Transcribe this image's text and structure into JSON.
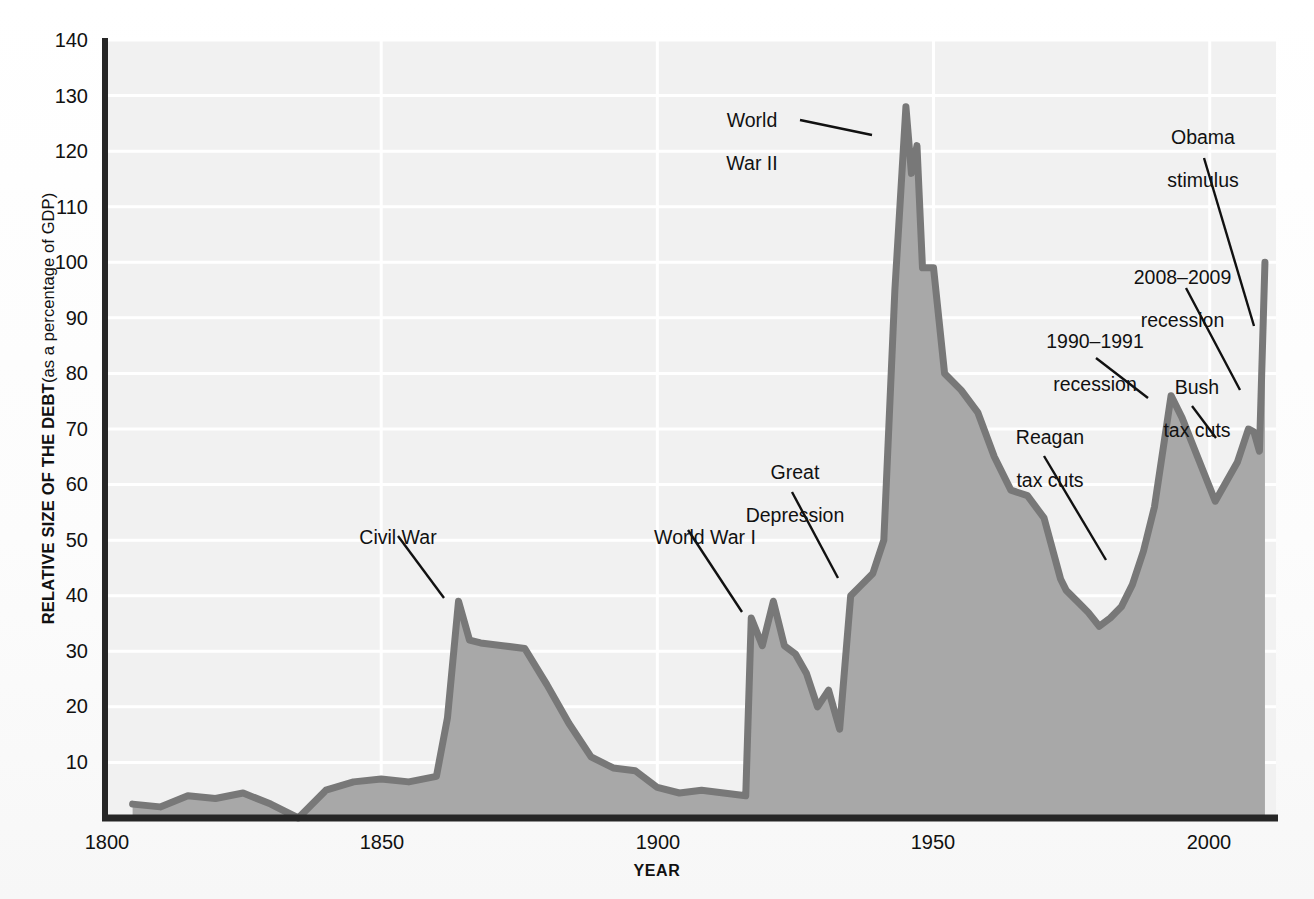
{
  "chart_data": {
    "type": "area",
    "title": "",
    "xlabel": "YEAR",
    "ylabel_bold": "RELATIVE SIZE OF THE DEBT",
    "ylabel_regular": "(as a percentage of GDP)",
    "xlim": [
      1800,
      2012
    ],
    "ylim": [
      0,
      140
    ],
    "xticks": [
      1800,
      1850,
      1900,
      1950,
      2000
    ],
    "xticklabels": [
      "1800",
      "1850",
      "1900",
      "1950",
      "2000"
    ],
    "yticks": [
      10,
      20,
      30,
      40,
      50,
      60,
      70,
      80,
      90,
      100,
      110,
      120,
      130,
      140
    ],
    "yticklabels": [
      "10",
      "20",
      "30",
      "40",
      "50",
      "60",
      "70",
      "80",
      "90",
      "100",
      "110",
      "120",
      "130",
      "140"
    ],
    "grid": "horizontal-and-vertical-white-gridlines",
    "legend": "none",
    "series_name": "U.S. federal debt as a percentage of GDP",
    "x": [
      1805,
      1810,
      1815,
      1820,
      1825,
      1830,
      1835,
      1840,
      1845,
      1850,
      1855,
      1860,
      1862,
      1864,
      1866,
      1868,
      1872,
      1876,
      1880,
      1884,
      1888,
      1892,
      1896,
      1900,
      1904,
      1908,
      1912,
      1916,
      1917,
      1919,
      1921,
      1923,
      1925,
      1927,
      1929,
      1931,
      1933,
      1935,
      1937,
      1939,
      1941,
      1943,
      1945,
      1946,
      1947,
      1948,
      1950,
      1952,
      1955,
      1958,
      1961,
      1964,
      1967,
      1970,
      1973,
      1974,
      1976,
      1978,
      1980,
      1982,
      1984,
      1986,
      1988,
      1990,
      1993,
      1995,
      1997,
      1999,
      2001,
      2003,
      2005,
      2007,
      2008,
      2009,
      2010
    ],
    "y": [
      2.5,
      2.0,
      4.0,
      3.5,
      4.5,
      2.5,
      0.0,
      5.0,
      6.5,
      7.0,
      6.5,
      7.5,
      18.0,
      39.0,
      32.0,
      31.5,
      31.0,
      30.5,
      24.0,
      17.0,
      11.0,
      9.0,
      8.5,
      5.5,
      4.5,
      5.0,
      4.5,
      4.0,
      36.0,
      31.0,
      39.0,
      31.0,
      29.5,
      26.0,
      20.0,
      23.0,
      16.0,
      40.0,
      42.0,
      44.0,
      50.0,
      95.0,
      128.0,
      116.0,
      121.0,
      99.0,
      99.0,
      80.0,
      77.0,
      73.0,
      65.0,
      59.0,
      58.0,
      54.0,
      43.0,
      41.0,
      39.0,
      37.0,
      34.5,
      36.0,
      38.0,
      42.0,
      48.0,
      56.0,
      76.0,
      72.0,
      67.0,
      62.0,
      57.0,
      60.5,
      64.0,
      70.0,
      69.5,
      66.0,
      100.0
    ],
    "annotations": [
      {
        "label": "Civil War",
        "lines": [
          "Civil War"
        ]
      },
      {
        "label": "World War I",
        "lines": [
          "World War I"
        ]
      },
      {
        "label": "Great Depression",
        "lines": [
          "Great",
          "Depression"
        ]
      },
      {
        "label": "World War II",
        "lines": [
          "World",
          "War II"
        ]
      },
      {
        "label": "Reagan tax cuts",
        "lines": [
          "Reagan",
          "tax cuts"
        ]
      },
      {
        "label": "1990-1991 recession",
        "lines": [
          "1990–1991",
          "recession"
        ]
      },
      {
        "label": "Bush tax cuts",
        "lines": [
          "Bush",
          "tax cuts"
        ]
      },
      {
        "label": "2008-2009 recession",
        "lines": [
          "2008–2009",
          "recession"
        ]
      },
      {
        "label": "Obama stimulus",
        "lines": [
          "Obama",
          "stimulus"
        ]
      }
    ],
    "colors": {
      "area_fill": "#a8a8a8",
      "line": "#787878",
      "plot_background": "#f1f1f1",
      "gridline": "#ffffff",
      "axis": "#262626",
      "text": "#111111"
    }
  },
  "axis": {
    "ytick_140": "140",
    "ytick_130": "130",
    "ytick_120": "120",
    "ytick_110": "110",
    "ytick_100": "100",
    "ytick_90": "90",
    "ytick_80": "80",
    "ytick_70": "70",
    "ytick_60": "60",
    "ytick_50": "50",
    "ytick_40": "40",
    "ytick_30": "30",
    "ytick_20": "20",
    "ytick_10": "10",
    "xtick_1800": "1800",
    "xtick_1850": "1850",
    "xtick_1900": "1900",
    "xtick_1950": "1950",
    "xtick_2000": "2000",
    "xlabel": "YEAR",
    "ylabel_bold": "RELATIVE SIZE OF THE DEBT",
    "ylabel_regular": "(as a percentage of GDP)"
  },
  "annotations": {
    "civil_war": "Civil War",
    "world_war_i": "World War I",
    "great_depression_l1": "Great",
    "great_depression_l2": "Depression",
    "world_war_ii_l1": "World",
    "world_war_ii_l2": "War II",
    "reagan_l1": "Reagan",
    "reagan_l2": "tax cuts",
    "recession_9091_l1": "1990–1991",
    "recession_9091_l2": "recession",
    "bush_l1": "Bush",
    "bush_l2": "tax cuts",
    "recession_0809_l1": "2008–2009",
    "recession_0809_l2": "recession",
    "obama_l1": "Obama",
    "obama_l2": "stimulus"
  }
}
